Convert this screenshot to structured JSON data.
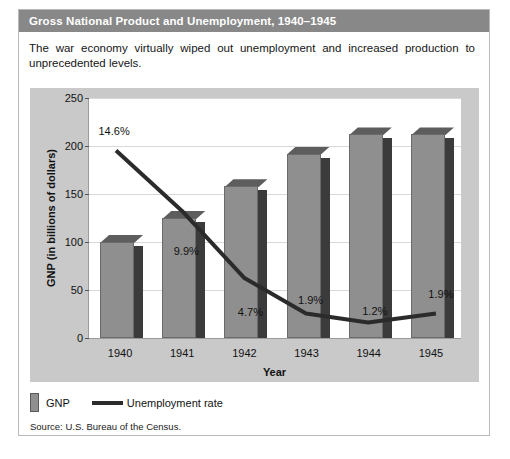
{
  "figure": {
    "title": "Gross National Product and Unemployment, 1940–1945",
    "caption": "The war economy virtually wiped out unemployment and increased production to unprecedented levels.",
    "source": "Source: U.S. Bureau of the Census."
  },
  "legend": {
    "gnp_label": "GNP",
    "unemployment_label": "Unemployment rate"
  },
  "colors": {
    "title_bar": "#888888",
    "bar_face": "#8f8f8f",
    "bar_side": "#3b3b3b",
    "bar_top": "#5d5d5d",
    "line": "#2b2b2b",
    "panel": "#c9c9c9",
    "plot_bg": "#ffffff",
    "grid": "#d8d8d8"
  },
  "chart_data": {
    "type": "bar",
    "title": "Gross National Product and Unemployment, 1940–1945",
    "xlabel": "Year",
    "ylabel": "GNP (in billions of dollars)",
    "categories": [
      "1940",
      "1941",
      "1942",
      "1943",
      "1944",
      "1945"
    ],
    "ylim": [
      0,
      250
    ],
    "yticks": [
      0,
      50,
      100,
      150,
      200,
      250
    ],
    "grid": true,
    "legend_position": "below",
    "series": [
      {
        "name": "GNP",
        "type": "bar",
        "unit": "billions of dollars",
        "values": [
          100,
          125,
          158,
          192,
          212,
          212
        ]
      },
      {
        "name": "Unemployment rate",
        "type": "line",
        "unit": "percent",
        "values": [
          14.6,
          9.9,
          4.7,
          1.9,
          1.2,
          1.9
        ],
        "labels": [
          "14.6%",
          "9.9%",
          "4.7%",
          "1.9%",
          "1.2%",
          "1.9%"
        ]
      }
    ]
  }
}
